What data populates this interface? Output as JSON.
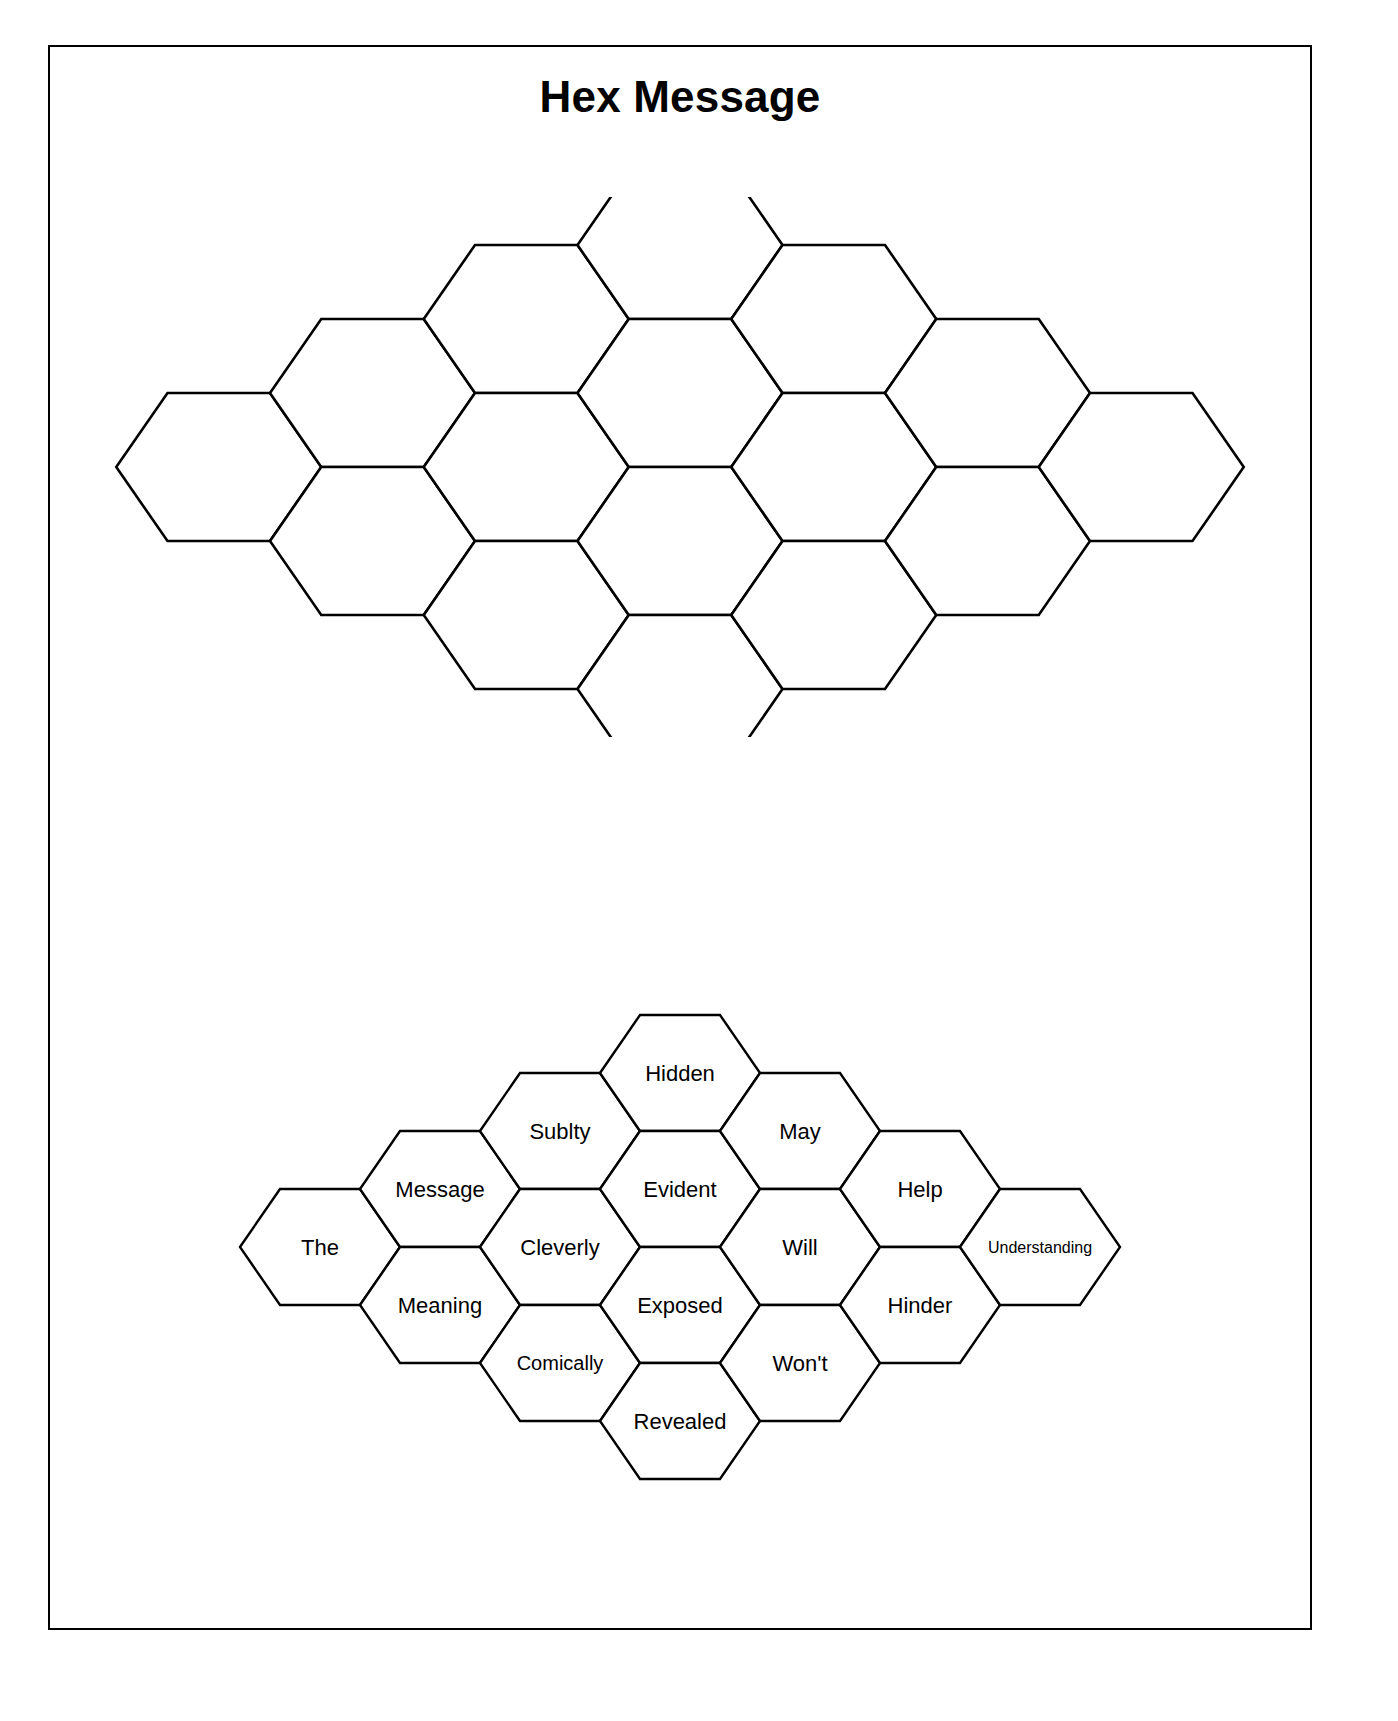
{
  "document": {
    "title": "Hex Message"
  },
  "grids": {
    "blank": {
      "name": "blank-hex-grid",
      "columns": [
        {
          "count": 1,
          "cells": [
            ""
          ]
        },
        {
          "count": 2,
          "cells": [
            "",
            ""
          ]
        },
        {
          "count": 3,
          "cells": [
            "",
            "",
            ""
          ]
        },
        {
          "count": 4,
          "cells": [
            "",
            "",
            "",
            ""
          ]
        },
        {
          "count": 3,
          "cells": [
            "",
            "",
            ""
          ]
        },
        {
          "count": 2,
          "cells": [
            "",
            ""
          ]
        },
        {
          "count": 1,
          "cells": [
            ""
          ]
        }
      ]
    },
    "answer": {
      "name": "answer-hex-grid",
      "columns": [
        {
          "count": 1,
          "cells": [
            "The"
          ]
        },
        {
          "count": 2,
          "cells": [
            "Message",
            "Meaning"
          ]
        },
        {
          "count": 3,
          "cells": [
            "Sublty",
            "Cleverly",
            "Comically"
          ]
        },
        {
          "count": 4,
          "cells": [
            "Hidden",
            "Evident",
            "Exposed",
            "Revealed"
          ]
        },
        {
          "count": 3,
          "cells": [
            "May",
            "Will",
            "Won't"
          ]
        },
        {
          "count": 2,
          "cells": [
            "Help",
            "Hinder"
          ]
        },
        {
          "count": 1,
          "cells": [
            "Understanding"
          ]
        }
      ]
    }
  },
  "words": [
    "The",
    "Message",
    "Meaning",
    "Sublty",
    "Cleverly",
    "Comically",
    "Hidden",
    "Evident",
    "Exposed",
    "Revealed",
    "May",
    "Will",
    "Won't",
    "Help",
    "Hinder",
    "Understanding"
  ],
  "colors": {
    "page_background": "#ffffff",
    "ink": "#000000",
    "frame_border": "#000000",
    "hex_fill": "#ffffff",
    "hex_stroke": "#000000"
  }
}
